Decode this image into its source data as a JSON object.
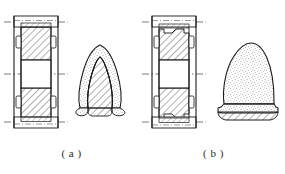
{
  "figure": {
    "kind": "engineering-drawing",
    "background_color": "#ffffff",
    "line_color": "#1a1a1a",
    "hatch_color": "#2b2b2b",
    "stipple_color": "#4a4a4a",
    "width": 285,
    "height": 174,
    "captions": [
      {
        "id": "a",
        "label": "( a )"
      },
      {
        "id": "b",
        "label": "( b )"
      }
    ]
  },
  "panels": [
    {
      "id": "a",
      "caption": "( a )",
      "section_view": {
        "name": "mold-section-a",
        "description": "vertical full section of a two-part mold with open central cavity",
        "outline": {
          "x": 14,
          "y": 16,
          "width": 44,
          "height": 112
        },
        "wall_left_x": 14,
        "wall_right_x": 58,
        "cavity": {
          "x": 21,
          "y": 60,
          "width": 30,
          "height": 28,
          "fill": "none"
        },
        "upper_block": {
          "x": 21,
          "y": 27,
          "width": 30,
          "height": 33,
          "hatched": true
        },
        "lower_block": {
          "x": 21,
          "y": 88,
          "width": 30,
          "height": 33,
          "hatched": true
        },
        "top_cap": {
          "x": 14,
          "y": 16,
          "width": 44,
          "height": 11
        },
        "bottom_cap": {
          "x": 14,
          "y": 117,
          "width": 44,
          "height": 11
        },
        "side_slots": [
          {
            "x": 16,
            "y": 36,
            "width": 5,
            "height": 12
          },
          {
            "x": 51,
            "y": 36,
            "width": 5,
            "height": 12
          },
          {
            "x": 16,
            "y": 96,
            "width": 5,
            "height": 12
          },
          {
            "x": 51,
            "y": 96,
            "width": 5,
            "height": 12
          }
        ],
        "center_lines": [
          {
            "y": 22,
            "x1": 4,
            "x2": 68
          },
          {
            "y": 74,
            "x1": 4,
            "x2": 68
          },
          {
            "y": 122,
            "x1": 4,
            "x2": 68
          }
        ]
      },
      "part_view": {
        "name": "molded-part-a",
        "shape": "hollow-arch",
        "description": "hollow arch / inverted U shaped casting, stippled outer surface with hatched cut section",
        "surface_texture": "stipple",
        "cut_face_texture": "hatch",
        "bounds": {
          "x": 72,
          "y": 42,
          "width": 56,
          "height": 68
        }
      }
    },
    {
      "id": "b",
      "caption": "( b )",
      "section_view": {
        "name": "mold-section-b",
        "description": "vertical full section of a two-part mold with stepped shoulders and open central cavity",
        "outline": {
          "x": 152,
          "y": 16,
          "width": 44,
          "height": 112
        },
        "wall_left_x": 152,
        "wall_right_x": 196,
        "cavity": {
          "x": 159,
          "y": 60,
          "width": 30,
          "height": 28,
          "fill": "none"
        },
        "upper_block": {
          "x": 159,
          "y": 27,
          "width": 30,
          "height": 33,
          "hatched": true,
          "stepped": true
        },
        "lower_block": {
          "x": 159,
          "y": 88,
          "width": 30,
          "height": 33,
          "hatched": true,
          "stepped": true
        },
        "top_cap": {
          "x": 152,
          "y": 16,
          "width": 44,
          "height": 11
        },
        "bottom_cap": {
          "x": 152,
          "y": 117,
          "width": 44,
          "height": 11
        },
        "side_slots": [
          {
            "x": 154,
            "y": 36,
            "width": 5,
            "height": 12
          },
          {
            "x": 189,
            "y": 36,
            "width": 5,
            "height": 12
          },
          {
            "x": 154,
            "y": 96,
            "width": 5,
            "height": 12
          },
          {
            "x": 189,
            "y": 96,
            "width": 5,
            "height": 12
          }
        ],
        "center_lines": [
          {
            "y": 22,
            "x1": 142,
            "x2": 206
          },
          {
            "y": 74,
            "x1": 142,
            "x2": 206
          },
          {
            "y": 122,
            "x1": 142,
            "x2": 206
          }
        ]
      },
      "part_view": {
        "name": "molded-part-b",
        "shape": "solid-dome-with-flange",
        "description": "solid bullet / dome shaped casting with flared flange base, stippled surface and hatched bottom cut",
        "surface_texture": "stipple",
        "cut_face_texture": "hatch",
        "bounds": {
          "x": 210,
          "y": 42,
          "width": 66,
          "height": 76
        }
      }
    }
  ]
}
